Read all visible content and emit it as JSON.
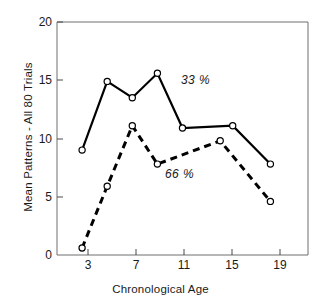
{
  "chart_data": {
    "type": "line",
    "title": "",
    "xlabel": "Chronological Age",
    "ylabel": "Mean Patterns - All 80 Trials",
    "xlim": [
      1,
      21
    ],
    "ylim": [
      0,
      20
    ],
    "xticks": [
      "3",
      "7",
      "11",
      "15",
      "19"
    ],
    "xtick_values": [
      3,
      7,
      11,
      15,
      19
    ],
    "yticks": [
      "0",
      "5",
      "10",
      "15",
      "20"
    ],
    "ytick_values": [
      0,
      5,
      10,
      15,
      20
    ],
    "grid": false,
    "legend": "inline-annotations",
    "series": [
      {
        "name": "33 %",
        "style": "solid",
        "marker": "open-circle",
        "x": [
          3,
          5,
          7,
          9,
          11,
          15,
          18
        ],
        "values": [
          9.0,
          14.9,
          13.5,
          15.6,
          10.9,
          11.1,
          7.8
        ]
      },
      {
        "name": "66 %",
        "style": "dashed",
        "marker": "open-circle",
        "x": [
          3,
          5,
          7,
          9,
          14,
          18
        ],
        "values": [
          0.6,
          5.9,
          11.1,
          7.8,
          9.8,
          4.6
        ]
      }
    ],
    "annotations": [
      {
        "text": "33 %",
        "x": 11.2,
        "y": 14.0
      },
      {
        "text": "66 %",
        "x": 12.2,
        "y": 7.3
      }
    ]
  }
}
